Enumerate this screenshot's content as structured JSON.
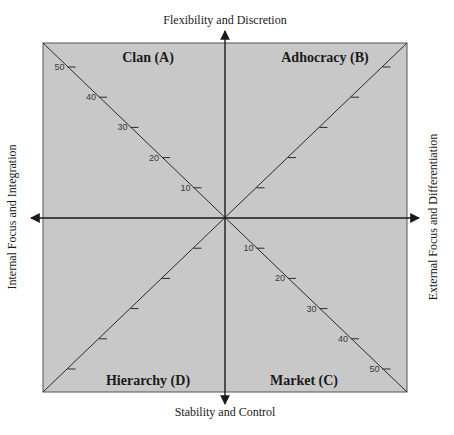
{
  "diagram": {
    "axes": {
      "top": "Flexibility and Discretion",
      "bottom": "Stability and Control",
      "left": "Internal Focus and Integration",
      "right": "External Focus and Differentiation"
    },
    "quadrants": [
      {
        "id": "A",
        "label": "Clan (A)",
        "position": "top-left"
      },
      {
        "id": "B",
        "label": "Adhocracy (B)",
        "position": "top-right"
      },
      {
        "id": "C",
        "label": "Market (C)",
        "position": "bottom-right"
      },
      {
        "id": "D",
        "label": "Hierarchy (D)",
        "position": "bottom-left"
      }
    ],
    "scale": {
      "ticks": [
        10,
        20,
        30,
        40,
        50
      ],
      "labeled_quadrants": [
        "A",
        "C"
      ],
      "unlabeled_quadrants": [
        "B",
        "D"
      ]
    },
    "colors": {
      "fill": "#c8c8c8",
      "line": "#2a2a2a",
      "background": "#ffffff"
    }
  }
}
